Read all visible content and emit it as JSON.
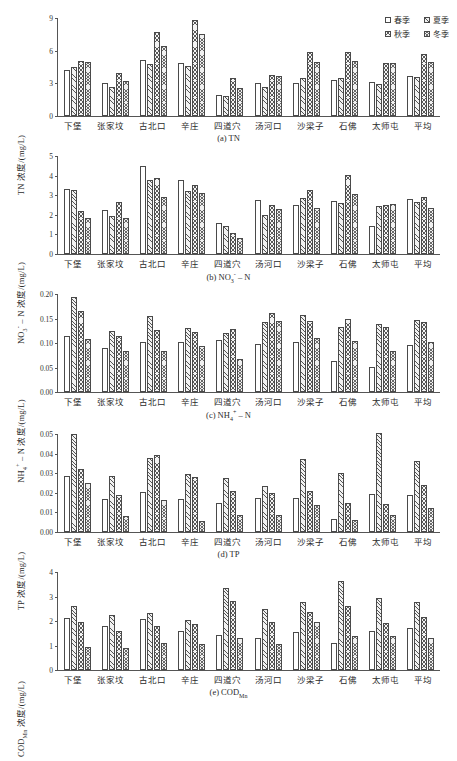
{
  "figure": {
    "legend": [
      {
        "label": "春季",
        "series": "spring"
      },
      {
        "label": "夏季",
        "series": "summer"
      },
      {
        "label": "秋季",
        "series": "autumn"
      },
      {
        "label": "冬季",
        "series": "winter"
      }
    ],
    "categories": [
      "下堡",
      "张家坟",
      "古北口",
      "辛庄",
      "四道穴",
      "汤河口",
      "沙梁子",
      "石佛",
      "太师屯",
      "平均"
    ]
  },
  "chart_data": [
    {
      "id": "tn",
      "type": "bar",
      "caption": "(a) TN",
      "title": "",
      "ylabel": "TN 浓度/(mg/L)",
      "xlabel": "",
      "ylim": [
        0,
        9
      ],
      "yticks": [
        "0",
        "3",
        "6",
        "9"
      ],
      "ytick_values": [
        0,
        3,
        6,
        9
      ],
      "grid": false,
      "legend_position": "top-right",
      "categories": [
        "下堡",
        "张家坟",
        "古北口",
        "辛庄",
        "四道穴",
        "汤河口",
        "沙梁子",
        "石佛",
        "太师屯",
        "平均"
      ],
      "series": [
        {
          "name": "春季",
          "values": [
            4.2,
            3.05,
            5.15,
            4.9,
            1.9,
            3.0,
            3.05,
            3.35,
            3.15,
            3.7
          ]
        },
        {
          "name": "夏季",
          "values": [
            4.5,
            2.7,
            4.8,
            4.6,
            1.85,
            2.7,
            3.45,
            3.5,
            2.95,
            3.55
          ]
        },
        {
          "name": "秋季",
          "values": [
            5.05,
            3.95,
            7.75,
            8.85,
            3.45,
            3.8,
            5.9,
            5.9,
            4.9,
            5.65
          ]
        },
        {
          "name": "冬季",
          "values": [
            4.95,
            3.25,
            6.4,
            7.55,
            2.55,
            3.7,
            5.0,
            5.05,
            4.85,
            4.95
          ]
        }
      ]
    },
    {
      "id": "no3n",
      "type": "bar",
      "caption": "(b) NO₃⁻ - N",
      "title": "",
      "ylabel": "NO₃⁻ - N 浓度/(mg/L)",
      "xlabel": "",
      "ylim": [
        0,
        5
      ],
      "yticks": [
        "0",
        "1",
        "2",
        "3",
        "4",
        "5"
      ],
      "ytick_values": [
        0,
        1,
        2,
        3,
        4,
        5
      ],
      "grid": false,
      "legend_position": "none",
      "categories": [
        "下堡",
        "张家坟",
        "古北口",
        "辛庄",
        "四道穴",
        "汤河口",
        "沙梁子",
        "石佛",
        "太师屯",
        "平均"
      ],
      "series": [
        {
          "name": "春季",
          "values": [
            3.33,
            2.27,
            4.47,
            3.79,
            1.58,
            2.76,
            2.51,
            2.69,
            1.45,
            2.81
          ]
        },
        {
          "name": "夏季",
          "values": [
            3.25,
            1.92,
            3.79,
            3.19,
            1.43,
            2.01,
            2.86,
            2.6,
            2.46,
            2.64
          ]
        },
        {
          "name": "秋季",
          "values": [
            2.18,
            2.63,
            3.86,
            3.51,
            1.07,
            2.5,
            3.28,
            4.05,
            2.48,
            2.89
          ]
        },
        {
          "name": "冬季",
          "values": [
            1.86,
            1.83,
            2.92,
            3.13,
            0.8,
            2.32,
            2.36,
            3.04,
            2.54,
            2.36
          ]
        }
      ]
    },
    {
      "id": "nh4n",
      "type": "bar",
      "caption": "(c) NH₄⁺ - N",
      "title": "",
      "ylabel": "NH₄⁺ - N 浓度/(mg/L)",
      "xlabel": "",
      "ylim": [
        0,
        0.2
      ],
      "yticks": [
        "0.00",
        "0.05",
        "0.10",
        "0.15",
        "0.20"
      ],
      "ytick_values": [
        0,
        0.05,
        0.1,
        0.15,
        0.2
      ],
      "grid": false,
      "legend_position": "none",
      "categories": [
        "下堡",
        "张家坟",
        "古北口",
        "辛庄",
        "四道穴",
        "汤河口",
        "沙梁子",
        "石佛",
        "太师屯",
        "平均"
      ],
      "series": [
        {
          "name": "春季",
          "values": [
            0.115,
            0.09,
            0.102,
            0.102,
            0.106,
            0.098,
            0.102,
            0.063,
            0.052,
            0.096
          ]
        },
        {
          "name": "夏季",
          "values": [
            0.193,
            0.125,
            0.155,
            0.13,
            0.12,
            0.143,
            0.157,
            0.132,
            0.139,
            0.147
          ]
        },
        {
          "name": "秋季",
          "values": [
            0.165,
            0.114,
            0.126,
            0.123,
            0.128,
            0.161,
            0.145,
            0.149,
            0.132,
            0.142
          ]
        },
        {
          "name": "冬季",
          "values": [
            0.108,
            0.084,
            0.084,
            0.093,
            0.068,
            0.144,
            0.111,
            0.105,
            0.084,
            0.102
          ]
        }
      ]
    },
    {
      "id": "tp",
      "type": "bar",
      "caption": "(d) TP",
      "title": "",
      "ylabel": "TP 浓度/(mg/L)",
      "xlabel": "",
      "ylim": [
        0,
        0.05
      ],
      "yticks": [
        "0.00",
        "0.01",
        "0.02",
        "0.03",
        "0.04",
        "0.05"
      ],
      "ytick_values": [
        0,
        0.01,
        0.02,
        0.03,
        0.04,
        0.05
      ],
      "grid": false,
      "legend_position": "none",
      "categories": [
        "下堡",
        "张家坟",
        "古北口",
        "辛庄",
        "四道穴",
        "汤河口",
        "沙梁子",
        "石佛",
        "太师屯",
        "平均"
      ],
      "series": [
        {
          "name": "春季",
          "values": [
            0.0288,
            0.0168,
            0.0205,
            0.0168,
            0.015,
            0.0172,
            0.0175,
            0.0067,
            0.0194,
            0.0188
          ]
        },
        {
          "name": "夏季",
          "values": [
            0.0498,
            0.0287,
            0.0379,
            0.0298,
            0.0277,
            0.0236,
            0.0372,
            0.0299,
            0.0507,
            0.0362
          ]
        },
        {
          "name": "秋季",
          "values": [
            0.0322,
            0.0188,
            0.0391,
            0.028,
            0.0209,
            0.02,
            0.0211,
            0.0147,
            0.0141,
            0.0242
          ]
        },
        {
          "name": "冬季",
          "values": [
            0.0251,
            0.0083,
            0.0165,
            0.0058,
            0.0085,
            0.0089,
            0.0138,
            0.0061,
            0.0089,
            0.0123
          ]
        }
      ]
    },
    {
      "id": "codmn",
      "type": "bar",
      "caption": "(e) CODMn",
      "title": "",
      "ylabel": "CODMn 浓度/(mg/L)",
      "xlabel": "",
      "ylim": [
        0,
        4
      ],
      "yticks": [
        "0",
        "1",
        "2",
        "3",
        "4"
      ],
      "ytick_values": [
        0,
        1,
        2,
        3,
        4
      ],
      "grid": false,
      "legend_position": "none",
      "categories": [
        "下堡",
        "张家坟",
        "古北口",
        "辛庄",
        "四道穴",
        "汤河口",
        "沙梁子",
        "石佛",
        "太师屯",
        "平均"
      ],
      "series": [
        {
          "name": "春季",
          "values": [
            2.14,
            1.79,
            2.09,
            1.6,
            1.43,
            1.3,
            1.56,
            1.11,
            1.6,
            1.71
          ]
        },
        {
          "name": "夏季",
          "values": [
            2.6,
            2.24,
            2.32,
            2.03,
            3.34,
            2.51,
            2.76,
            3.62,
            2.95,
            2.77
          ]
        },
        {
          "name": "秋季",
          "values": [
            1.97,
            1.58,
            1.78,
            1.87,
            2.8,
            1.98,
            2.37,
            2.6,
            1.9,
            2.16
          ]
        },
        {
          "name": "冬季",
          "values": [
            0.92,
            0.91,
            1.12,
            1.05,
            1.31,
            1.08,
            1.95,
            1.37,
            1.4,
            1.3
          ]
        }
      ]
    }
  ]
}
